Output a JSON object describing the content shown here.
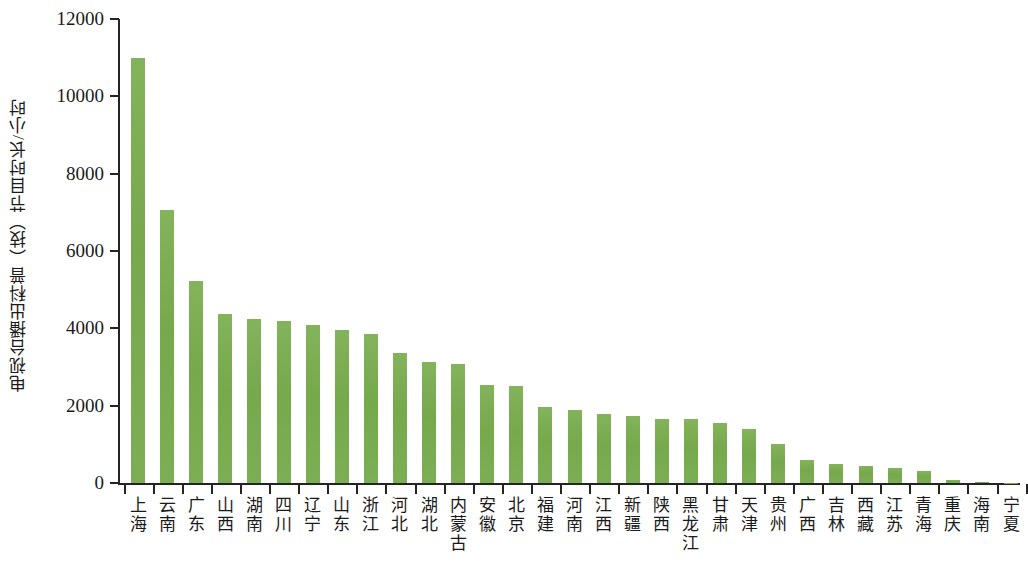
{
  "chart_data": {
    "type": "bar",
    "title": "",
    "xlabel": "",
    "ylabel": "电视台播出科普（技）节目时长/小时",
    "ylim": [
      0,
      12000
    ],
    "ytick_values": [
      0,
      2000,
      4000,
      6000,
      8000,
      10000,
      12000
    ],
    "ytick_labels": [
      "0",
      "2000",
      "4000",
      "6000",
      "8000",
      "10000",
      "12000"
    ],
    "grid": false,
    "legend": null,
    "bar_color": "#7aad52",
    "axis_color": "#242424",
    "categories": [
      "上海",
      "云南",
      "广东",
      "山西",
      "湖南",
      "四川",
      "辽宁",
      "山东",
      "浙江",
      "河北",
      "湖北",
      "内蒙古",
      "安徽",
      "北京",
      "福建",
      "河南",
      "江西",
      "新疆",
      "陕西",
      "黑龙江",
      "甘肃",
      "天津",
      "贵州",
      "广西",
      "吉林",
      "西藏",
      "江苏",
      "青海",
      "重庆",
      "海南",
      "宁夏"
    ],
    "values": [
      10990,
      7050,
      5230,
      4360,
      4250,
      4180,
      4080,
      3960,
      3860,
      3350,
      3120,
      3080,
      2540,
      2520,
      1960,
      1900,
      1780,
      1730,
      1660,
      1660,
      1550,
      1390,
      1000,
      600,
      480,
      440,
      400,
      300,
      70,
      20,
      10
    ]
  }
}
